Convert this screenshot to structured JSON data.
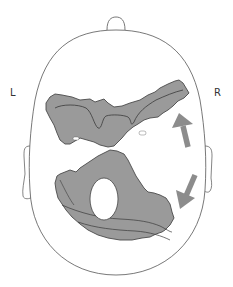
{
  "diagram": {
    "type": "axial head schematic (top-down view)",
    "labels": {
      "left": "L",
      "right": "R"
    },
    "elements": [
      {
        "name": "head-outline",
        "description": "oval head outline viewed from above"
      },
      {
        "name": "nose",
        "description": "small bump at top of head indicating nose/anterior"
      },
      {
        "name": "left-ear",
        "description": "ear on left side"
      },
      {
        "name": "right-ear",
        "description": "ear on right side"
      },
      {
        "name": "anterior-lesion",
        "description": "grey shaded region spanning anterior head, irregular outline with inner contour line"
      },
      {
        "name": "posterior-lesion",
        "description": "grey shaded region in posterior head with central white hole and layered contours"
      },
      {
        "name": "arrow-up",
        "description": "grey arrow pointing up/anterior on right side"
      },
      {
        "name": "arrow-down",
        "description": "grey arrow pointing down-left/posterior on right side"
      }
    ],
    "colors": {
      "outline": "#555555",
      "lesion_fill": "#9a9a9a",
      "lesion_edge": "#4a4a4a",
      "arrow": "#8c8c8c",
      "background": "#ffffff"
    }
  }
}
